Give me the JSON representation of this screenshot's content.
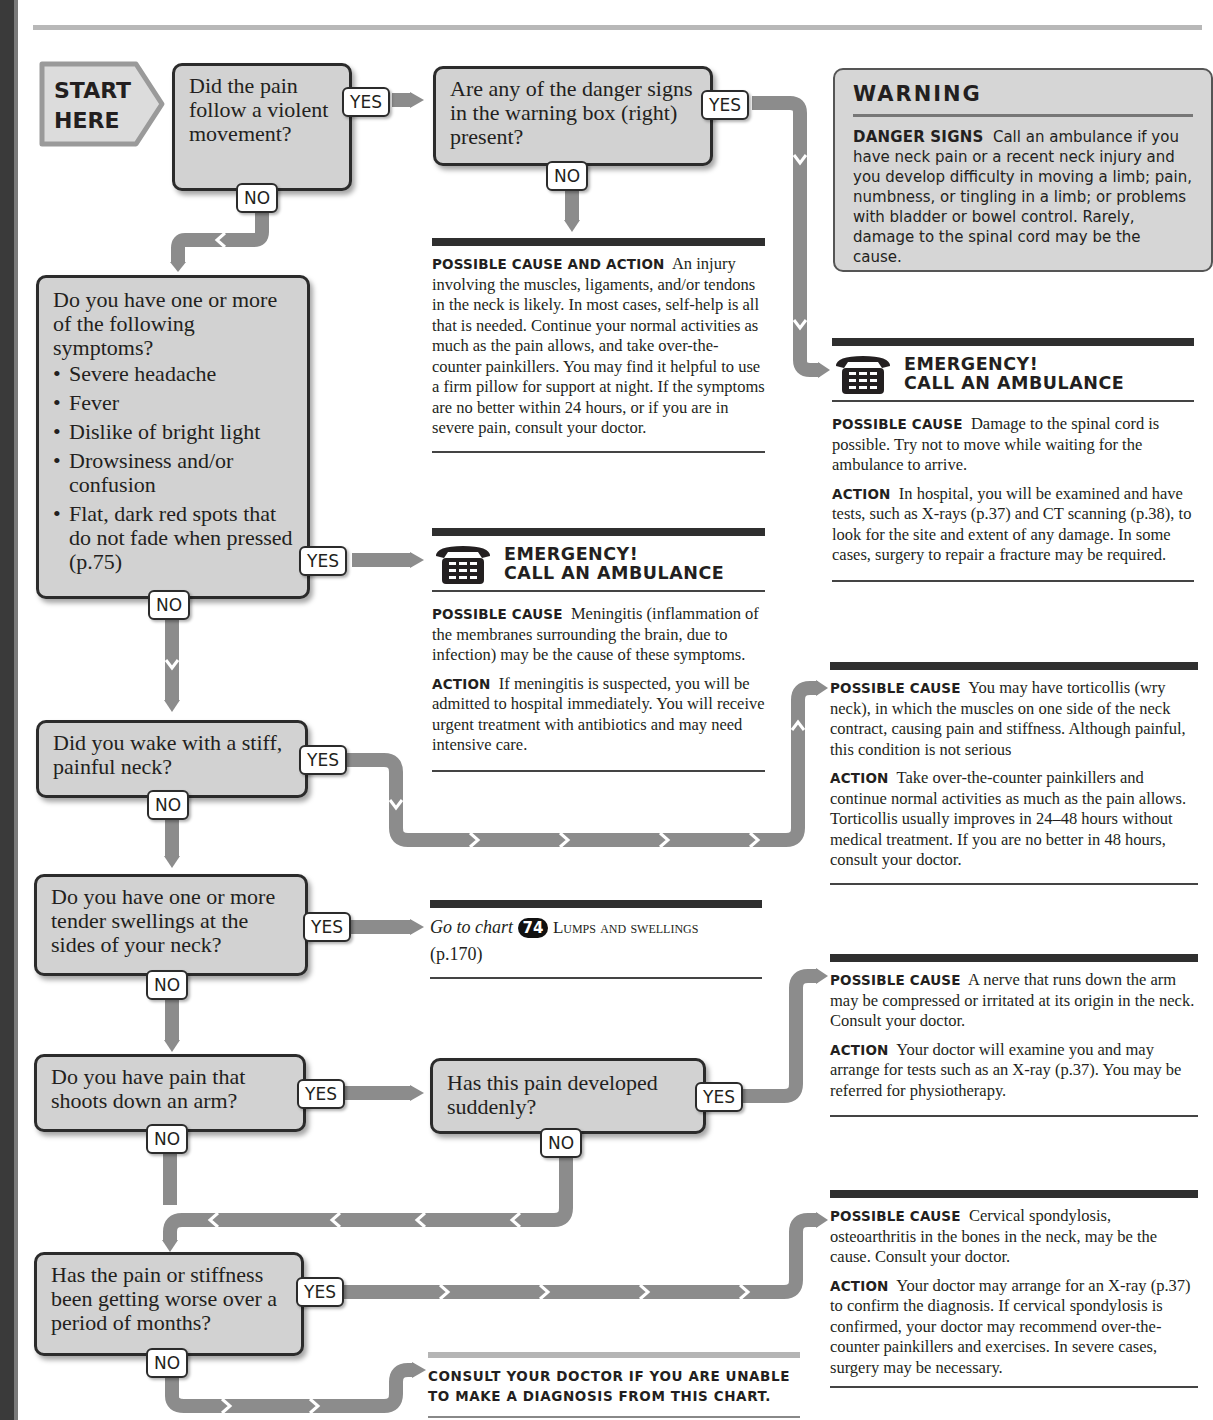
{
  "start": {
    "line1": "START",
    "line2": "HERE"
  },
  "labels": {
    "yes": "YES",
    "no": "NO"
  },
  "questions": [
    {
      "id": "q1",
      "text": "Did the pain follow a violent movement?"
    },
    {
      "id": "q2",
      "text": "Are any of the danger signs in the warning box (right) present?"
    },
    {
      "id": "q3",
      "text": "Do you have one or more of the following symptoms?",
      "symptoms": [
        "Severe headache",
        "Fever",
        "Dislike of bright light",
        "Drowsiness and/or confusion",
        "Flat, dark red spots that do not fade when pressed (p.75)"
      ]
    },
    {
      "id": "q4",
      "text": "Did you wake with a stiff, painful neck?"
    },
    {
      "id": "q5",
      "text": "Do you have one or more tender swellings at the sides of your neck?"
    },
    {
      "id": "q6",
      "text": "Do you have pain that shoots down an arm?"
    },
    {
      "id": "q7",
      "text": "Has this pain developed suddenly?"
    },
    {
      "id": "q8",
      "text": "Has the pain or stiffness been getting worse over a period of months?"
    }
  ],
  "warning": {
    "title": "WARNING",
    "heading": "Danger signs",
    "body": "Call an ambulance if you have neck pain or a recent neck injury and you develop difficulty in moving a limb; pain, numbness, or tingling in a limb; or problems with bladder or bowel control. Rarely, damage to the spinal cord may be the cause."
  },
  "emergency": {
    "line1": "EMERGENCY!",
    "line2": "CALL AN AMBULANCE"
  },
  "outcomes": {
    "injury": {
      "heading": "Possible cause and action",
      "text": "An injury involving the muscles, ligaments, and/or tendons in the neck is likely. In most cases, self-help is all that is needed. Continue your normal activities as much as the pain allows, and take over-the-counter painkillers. You may find it helpful to use a firm pillow for support at night. If the symptoms are no better within 24 hours, or if you are in severe pain, consult your doctor."
    },
    "spinal": {
      "cause_heading": "Possible cause",
      "cause": "Damage to the spinal cord is possible. Try not to move while waiting for the ambulance to arrive.",
      "action_heading": "Action",
      "action": "In hospital, you will be examined and have tests, such as X-rays (p.37) and CT scanning (p.38), to look for the site and extent of any damage. In some cases, surgery to repair a fracture may be required."
    },
    "meningitis": {
      "cause_heading": "Possible cause",
      "cause": "Meningitis (inflammation of the membranes surrounding the brain, due to infection) may be the cause of these symptoms.",
      "action_heading": "Action",
      "action": "If meningitis is suspected, you will be admitted to hospital immediately. You will receive urgent treatment with antibiotics and may need intensive care."
    },
    "torticollis": {
      "cause_heading": "Possible cause",
      "cause": "You may have torticollis (wry neck), in which the muscles on one side of the neck contract, causing pain and stiffness. Although painful, this condition is not serious",
      "action_heading": "Action",
      "action": "Take over-the-counter painkillers and continue normal activities as much as the pain allows. Torticollis usually improves in 24–48 hours without medical treatment. If you are no better in 48 hours, consult your doctor."
    },
    "lumps": {
      "prefix": "Go to chart",
      "chart_number": "74",
      "chart_title": "Lumps and swellings",
      "page": "(p.170)"
    },
    "nerve": {
      "cause_heading": "Possible cause",
      "cause": "A nerve that runs down the arm may be compressed or irritated at its origin in the neck. Consult your doctor.",
      "action_heading": "Action",
      "action": "Your doctor will examine you and may arrange for tests such as an X-ray (p.37). You may be referred for physiotherapy."
    },
    "spondylosis": {
      "cause_heading": "Possible cause",
      "cause": "Cervical spondylosis, osteoarthritis in the bones in the neck, may be the cause. Consult your doctor.",
      "action_heading": "Action",
      "action": "Your doctor may arrange for an X-ray (p.37) to confirm the diagnosis. If cervical spondylosis is confirmed, your doctor may recommend over-the-counter painkillers and exercises. In severe cases, surgery may be necessary."
    },
    "consult": {
      "text": "Consult your doctor if you are unable to make a diagnosis from this chart."
    }
  },
  "colors": {
    "box_fill": "#d2d2d2",
    "arrow": "#8c8c8c",
    "border": "#2b2b2b",
    "rule": "#2f2f2f"
  }
}
